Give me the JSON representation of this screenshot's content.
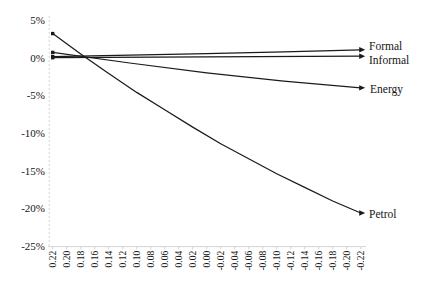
{
  "figure": {
    "background": "#ffffff",
    "text_color": "#141414",
    "axis_color": "#d6d6d6"
  },
  "chart_data": {
    "type": "line",
    "title": "",
    "xlabel": "",
    "ylabel": "",
    "grid": false,
    "legend_position": "end-of-line labels (right side)",
    "x_range": [
      0.22,
      -0.22
    ],
    "ylim": [
      -25,
      5
    ],
    "y_ticks": [
      "5%",
      "0%",
      "-5%",
      "-10%",
      "-15%",
      "-20%",
      "-25%"
    ],
    "x_ticks": [
      "0.22",
      "0.20",
      "0.18",
      "0.16",
      "0.14",
      "0.12",
      "0.10",
      "0.08",
      "0.06",
      "0.04",
      "0.02",
      "0.00",
      "-0.02",
      "-0.04",
      "-0.06",
      "-0.08",
      "-0.10",
      "-0.12",
      "-0.14",
      "-0.16",
      "-0.18",
      "-0.20",
      "-0.22"
    ],
    "x_tick_rotation_deg": -90,
    "series": [
      {
        "name": "Formal",
        "color": "#1b1b1b",
        "points": [
          [
            0.22,
            0.15
          ],
          [
            0.11,
            0.33
          ],
          [
            0.0,
            0.55
          ],
          [
            -0.11,
            0.78
          ],
          [
            -0.22,
            1.05
          ]
        ]
      },
      {
        "name": "Informal",
        "color": "#1b1b1b",
        "points": [
          [
            0.22,
            0.0
          ],
          [
            0.0,
            0.1
          ],
          [
            -0.22,
            0.2
          ]
        ]
      },
      {
        "name": "Energy",
        "color": "#1b1b1b",
        "points": [
          [
            0.22,
            0.7
          ],
          [
            0.11,
            -0.7
          ],
          [
            0.0,
            -2.0
          ],
          [
            -0.11,
            -3.1
          ],
          [
            -0.22,
            -4.0
          ]
        ]
      },
      {
        "name": "Petrol",
        "color": "#1b1b1b",
        "points": [
          [
            0.22,
            3.2
          ],
          [
            0.18,
            0.5
          ],
          [
            0.14,
            -2.1
          ],
          [
            0.1,
            -4.6
          ],
          [
            0.06,
            -6.9
          ],
          [
            0.02,
            -9.2
          ],
          [
            -0.02,
            -11.4
          ],
          [
            -0.06,
            -13.4
          ],
          [
            -0.1,
            -15.4
          ],
          [
            -0.14,
            -17.2
          ],
          [
            -0.18,
            -19.0
          ],
          [
            -0.22,
            -20.6
          ]
        ]
      }
    ]
  }
}
